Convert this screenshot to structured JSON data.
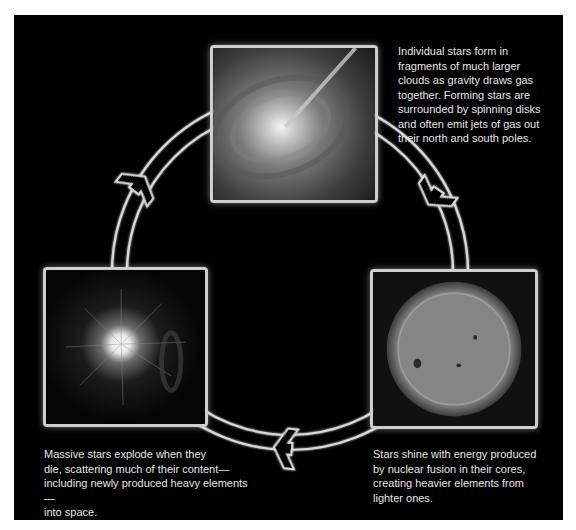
{
  "diagram": {
    "colors": {
      "background": "#000000",
      "frame": "#ffffff",
      "ring_outline": "#d8d8d8",
      "caption_text": "#e6e6e6"
    },
    "stages": [
      {
        "id": "star-formation",
        "image": "forming-star-disk-with-jet",
        "caption": "Individual stars form in\nfragments of much larger\nclouds as gravity draws gas\ntogether. Forming stars are\nsurrounded by spinning disks\nand often emit jets of gas out\ntheir north and south poles."
      },
      {
        "id": "main-sequence",
        "image": "sun-with-sunspots",
        "caption": "Stars shine with energy produced\nby nuclear fusion in their cores,\ncreating heavier elements from\nlighter ones."
      },
      {
        "id": "supernova",
        "image": "supernova-explosion",
        "caption": "Massive stars explode when they\ndie, scattering much of their content—\nincluding newly produced heavy elements—\ninto space."
      }
    ],
    "arrows": [
      {
        "from": "star-formation",
        "to": "main-sequence",
        "icon": "arrow-clockwise-down-right-icon"
      },
      {
        "from": "main-sequence",
        "to": "supernova",
        "icon": "arrow-clockwise-left-icon"
      },
      {
        "from": "supernova",
        "to": "star-formation",
        "icon": "arrow-clockwise-up-right-icon"
      }
    ]
  }
}
